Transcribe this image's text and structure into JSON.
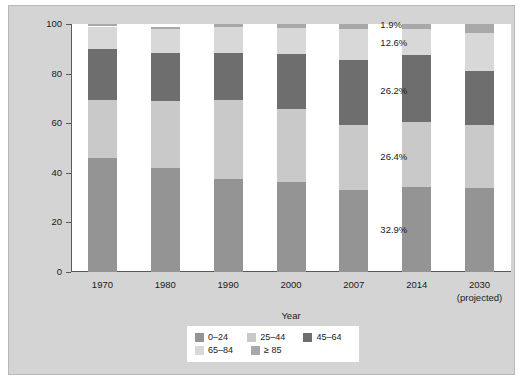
{
  "chart_data": {
    "type": "bar",
    "subtype": "stacked-percentage",
    "title": "",
    "xlabel": "Year",
    "ylabel": "Percentage of total population",
    "ylim": [
      0,
      100
    ],
    "yticks": [
      0,
      20,
      40,
      60,
      80,
      100
    ],
    "ytick_labels": [
      "0",
      "20",
      "40",
      "60",
      "80",
      "100"
    ],
    "grid": false,
    "legend_position": "bottom-center",
    "categories": [
      "1970",
      "1980",
      "1990",
      "2000",
      "2007",
      "2014",
      "2030"
    ],
    "category_sublabels": [
      "",
      "",
      "",
      "",
      "",
      "",
      "(projected)"
    ],
    "series": [
      {
        "name": "0–24",
        "color": "#949494",
        "values": [
          46.0,
          41.8,
          37.4,
          36.2,
          32.9,
          34.4,
          34.0
        ]
      },
      {
        "name": "25–44",
        "color": "#c9c9c9",
        "values": [
          23.5,
          27.1,
          32.1,
          29.6,
          26.4,
          26.1,
          25.2
        ]
      },
      {
        "name": "45–64",
        "color": "#6e6e6e",
        "values": [
          20.6,
          19.6,
          18.7,
          22.3,
          26.2,
          27.0,
          21.9
        ]
      },
      {
        "name": "65–84",
        "color": "#d8d8d8",
        "values": [
          8.9,
          9.5,
          10.5,
          10.3,
          12.6,
          10.4,
          15.4
        ]
      },
      {
        "name": "≥ 85",
        "color": "#a8a8a8",
        "values": [
          1.0,
          1.0,
          1.3,
          1.6,
          1.9,
          2.1,
          3.5
        ]
      }
    ],
    "annotations": [
      {
        "text": "1.9%",
        "series": "≥ 85",
        "category": "2007"
      },
      {
        "text": "12.6%",
        "series": "65–84",
        "category": "2007"
      },
      {
        "text": "26.2%",
        "series": "45–64",
        "category": "2007"
      },
      {
        "text": "26.4%",
        "series": "25–44",
        "category": "2007"
      },
      {
        "text": "32.9%",
        "series": "0–24",
        "category": "2007"
      }
    ]
  },
  "axes": {
    "y_title": "Percentage of total population",
    "x_title": "Year",
    "y_ticks": [
      "100",
      "80",
      "60",
      "40",
      "20",
      "0"
    ],
    "x_ticks": [
      {
        "label": "1970",
        "sub": ""
      },
      {
        "label": "1980",
        "sub": ""
      },
      {
        "label": "1990",
        "sub": ""
      },
      {
        "label": "2000",
        "sub": ""
      },
      {
        "label": "2007",
        "sub": ""
      },
      {
        "label": "2014",
        "sub": ""
      },
      {
        "label": "2030",
        "sub": "(projected)"
      }
    ]
  },
  "annotations": {
    "a0": "1.9%",
    "a1": "12.6%",
    "a2": "26.2%",
    "a3": "26.4%",
    "a4": "32.9%"
  },
  "legend": {
    "items": [
      {
        "label": "0–24",
        "color": "#949494"
      },
      {
        "label": "25–44",
        "color": "#c9c9c9"
      },
      {
        "label": "45–64",
        "color": "#6e6e6e"
      },
      {
        "label": "65–84",
        "color": "#d8d8d8"
      },
      {
        "label": "≥ 85",
        "color": "#a8a8a8"
      }
    ]
  },
  "colors": {
    "page_background": "#ffffff",
    "plate_background": "#d4d4d4",
    "plot_background": "#ffffff",
    "axis": "#5a5a5a",
    "text": "#1a1a1a"
  }
}
